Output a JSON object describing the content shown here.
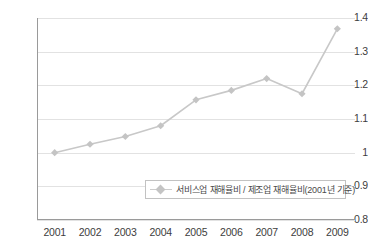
{
  "chart_data": {
    "type": "line",
    "title": "",
    "subtitle": "",
    "xlabel": "",
    "ylabel": "",
    "categories": [
      "2001",
      "2002",
      "2003",
      "2004",
      "2005",
      "2006",
      "2007",
      "2008",
      "2009"
    ],
    "series": [
      {
        "name": "서비스업 재해율비 / 제조업 재해율비(2001년 기준)",
        "values": [
          1.0,
          1.025,
          1.048,
          1.08,
          1.157,
          1.185,
          1.22,
          1.175,
          1.368
        ],
        "color": "#c8c8c8",
        "marker": "diamond"
      }
    ],
    "ylim": [
      0.8,
      1.4
    ],
    "ytick_values": [
      1.4,
      1.3,
      1.2,
      1.1,
      1.0,
      0.9,
      0.8
    ],
    "ytick_labels": [
      "1.4",
      "1.3",
      "1.2",
      "1.1",
      "1",
      "0.9",
      "0.8"
    ],
    "grid": true,
    "grid_axis": "y",
    "legend_position": "bottom-right-inside"
  },
  "legend": {
    "entries": [
      {
        "label": "서비스업 재해율비 / 제조업 재해율비(2001년 기준)",
        "marker_icon": "diamond-marker-icon"
      }
    ]
  },
  "colors": {
    "series_line": "#c8c8c8",
    "series_marker": "#c4c4c4",
    "gridline": "#e2e2e2",
    "axis": "#9a9a9a",
    "tick_text": "#3d3d3d",
    "legend_border": "#c2c2c2",
    "legend_text": "#4a4a4a",
    "background": "#ffffff"
  }
}
